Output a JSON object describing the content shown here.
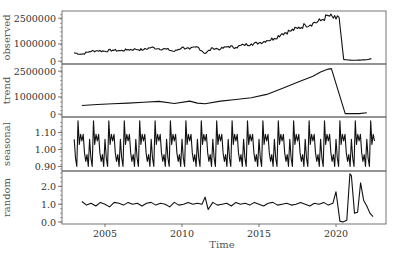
{
  "chart_data": {
    "type": "line",
    "title": "",
    "xlabel": "Time",
    "x_range": [
      2002.25,
      2023.0
    ],
    "x_ticks": [
      2005,
      2010,
      2015,
      2020
    ],
    "x_tick_labels": [
      "2005",
      "2010",
      "2015",
      "2020"
    ],
    "grid": false,
    "legend": null,
    "panels": [
      {
        "name": "observed",
        "ylabel": "observed",
        "ylim": [
          -50000,
          2800000
        ],
        "y_ticks": [
          0,
          1000000,
          2500000
        ],
        "y_tick_labels": [
          "0",
          "1000000",
          "2500000"
        ],
        "x": [
          2003.0,
          2003.5,
          2004.0,
          2004.5,
          2005.0,
          2005.5,
          2006.0,
          2006.5,
          2007.0,
          2007.5,
          2008.0,
          2008.5,
          2009.0,
          2009.5,
          2010.0,
          2010.5,
          2011.0,
          2011.5,
          2012.0,
          2012.5,
          2013.0,
          2013.5,
          2014.0,
          2014.5,
          2015.0,
          2015.5,
          2016.0,
          2016.5,
          2017.0,
          2017.5,
          2018.0,
          2018.5,
          2019.0,
          2019.5,
          2020.0,
          2020.2,
          2020.5,
          2021.0,
          2021.5,
          2022.0,
          2022.3
        ],
        "values": [
          480000,
          400000,
          560000,
          610000,
          580000,
          640000,
          600000,
          670000,
          690000,
          660000,
          800000,
          720000,
          700000,
          560000,
          800000,
          700000,
          830000,
          450000,
          760000,
          700000,
          860000,
          800000,
          950000,
          1000000,
          1060000,
          1200000,
          1320000,
          1600000,
          1750000,
          1900000,
          2100000,
          2200000,
          2350000,
          2650000,
          2450000,
          2550000,
          100000,
          50000,
          60000,
          80000,
          150000
        ]
      },
      {
        "name": "trend",
        "ylabel": "trend",
        "ylim": [
          -50000,
          2800000
        ],
        "y_ticks": [
          0,
          1000000,
          2500000
        ],
        "y_tick_labels": [
          "0",
          "1000000",
          "2500000"
        ],
        "x": [
          2003.5,
          2004.5,
          2005.5,
          2006.5,
          2007.5,
          2008.5,
          2009.5,
          2010.5,
          2011.0,
          2011.5,
          2012.5,
          2013.5,
          2014.5,
          2015.5,
          2016.5,
          2017.5,
          2018.5,
          2019.0,
          2019.5,
          2019.7,
          2020.6,
          2021.0,
          2021.5,
          2022.0
        ],
        "values": [
          500000,
          560000,
          600000,
          640000,
          690000,
          740000,
          620000,
          760000,
          640000,
          600000,
          760000,
          850000,
          950000,
          1150000,
          1500000,
          1850000,
          2200000,
          2450000,
          2620000,
          2650000,
          30000,
          30000,
          30000,
          80000
        ]
      },
      {
        "name": "seasonal",
        "ylabel": "seasonal",
        "ylim": [
          0.885,
          1.18
        ],
        "y_ticks": [
          0.9,
          1.0,
          1.1
        ],
        "y_tick_labels": [
          "0.90",
          "1.00",
          "1.10"
        ],
        "period_start": 2003.0,
        "period_end": 2022.5,
        "monthly_pattern": [
          1.06,
          0.95,
          0.9,
          1.17,
          1.03,
          1.09,
          1.05,
          1.09,
          0.98,
          0.93,
          0.97,
          0.9
        ]
      },
      {
        "name": "random",
        "ylabel": "random",
        "ylim": [
          0.0,
          2.75
        ],
        "y_ticks": [
          0.0,
          1.0,
          2.0
        ],
        "y_tick_labels": [
          "0.0",
          "1.0",
          "2.0"
        ],
        "x": [
          2003.5,
          2003.8,
          2004.1,
          2004.4,
          2004.7,
          2005.0,
          2005.3,
          2005.6,
          2005.9,
          2006.2,
          2006.5,
          2006.8,
          2007.1,
          2007.4,
          2007.7,
          2008.0,
          2008.3,
          2008.6,
          2008.9,
          2009.2,
          2009.5,
          2009.8,
          2010.1,
          2010.4,
          2010.7,
          2011.0,
          2011.3,
          2011.5,
          2011.7,
          2012.0,
          2012.3,
          2012.6,
          2012.9,
          2013.2,
          2013.5,
          2013.8,
          2014.1,
          2014.4,
          2014.7,
          2015.0,
          2015.3,
          2015.6,
          2015.9,
          2016.2,
          2016.5,
          2016.8,
          2017.1,
          2017.4,
          2017.7,
          2018.0,
          2018.3,
          2018.6,
          2018.9,
          2019.2,
          2019.5,
          2019.8,
          2020.0,
          2020.25,
          2020.45,
          2020.7,
          2020.9,
          2021.0,
          2021.2,
          2021.4,
          2021.6,
          2021.8,
          2022.0,
          2022.2,
          2022.4
        ],
        "values": [
          1.15,
          0.95,
          1.05,
          0.9,
          1.1,
          1.0,
          0.85,
          1.1,
          1.05,
          0.95,
          1.1,
          1.0,
          1.05,
          0.9,
          1.05,
          1.1,
          0.95,
          1.05,
          1.0,
          0.85,
          1.1,
          0.95,
          1.0,
          1.1,
          1.0,
          1.05,
          1.0,
          1.4,
          0.7,
          1.1,
          0.95,
          1.0,
          1.05,
          0.9,
          1.1,
          1.0,
          1.05,
          0.95,
          1.1,
          1.0,
          0.9,
          1.05,
          1.1,
          0.95,
          1.0,
          1.05,
          0.95,
          1.0,
          1.1,
          1.0,
          0.9,
          1.05,
          1.0,
          1.1,
          0.95,
          1.05,
          1.7,
          0.05,
          0.0,
          0.1,
          2.7,
          2.6,
          0.5,
          0.55,
          2.2,
          1.2,
          0.9,
          0.5,
          0.3
        ]
      }
    ]
  },
  "axes": {
    "x_title": "Time",
    "panel_labels": [
      "observed",
      "trend",
      "seasonal",
      "random"
    ]
  }
}
